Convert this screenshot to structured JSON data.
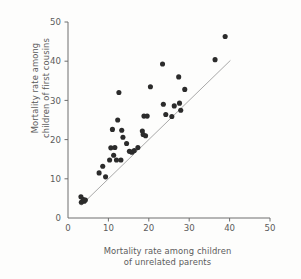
{
  "chart_data": {
    "type": "scatter",
    "title": "",
    "xlabel": "Mortality rate among children of unrelated parents",
    "xlabel_line1": "Mortality rate among children",
    "xlabel_line2": "of unrelated parents",
    "ylabel": "Mortality rate among children of first cousins",
    "ylabel_line1": "Mortality rate among",
    "ylabel_line2": "children of first cousins",
    "xlim": [
      0,
      50
    ],
    "ylim": [
      0,
      50
    ],
    "xticks": [
      0,
      10,
      20,
      30,
      40,
      50
    ],
    "yticks": [
      0,
      10,
      20,
      30,
      40,
      50
    ],
    "xticklabels": [
      "0",
      "10",
      "20",
      "30",
      "40",
      "50"
    ],
    "yticklabels": [
      "0",
      "10",
      "20",
      "30",
      "40",
      "50"
    ],
    "grid": false,
    "legend": null,
    "point_color": "#2b2b2b",
    "point_size": 3.1,
    "reference_line": {
      "label": "line of equality",
      "x": [
        3.2,
        40.2
      ],
      "y": [
        3.2,
        40.2
      ],
      "color": "#a9a9a9",
      "width": 1.0
    },
    "series": [
      {
        "name": "Populations",
        "points": [
          [
            3.2,
            5.4
          ],
          [
            3.3,
            4.0
          ],
          [
            3.8,
            4.7
          ],
          [
            4.0,
            4.3
          ],
          [
            4.3,
            4.6
          ],
          [
            7.7,
            11.5
          ],
          [
            8.6,
            13.2
          ],
          [
            9.3,
            10.5
          ],
          [
            10.3,
            14.8
          ],
          [
            10.6,
            17.9
          ],
          [
            11.0,
            22.6
          ],
          [
            11.3,
            16.0
          ],
          [
            11.6,
            18.0
          ],
          [
            12.0,
            14.8
          ],
          [
            12.3,
            25.0
          ],
          [
            12.6,
            32.0
          ],
          [
            13.1,
            14.8
          ],
          [
            13.3,
            22.4
          ],
          [
            13.6,
            20.6
          ],
          [
            14.5,
            19.0
          ],
          [
            15.2,
            17.0
          ],
          [
            15.8,
            16.8
          ],
          [
            16.4,
            17.2
          ],
          [
            17.3,
            18.0
          ],
          [
            18.4,
            22.2
          ],
          [
            18.6,
            21.3
          ],
          [
            18.8,
            26.0
          ],
          [
            19.2,
            21.0
          ],
          [
            19.6,
            26.0
          ],
          [
            20.4,
            33.5
          ],
          [
            23.4,
            39.3
          ],
          [
            23.6,
            29.0
          ],
          [
            24.2,
            26.4
          ],
          [
            25.7,
            25.9
          ],
          [
            26.3,
            28.6
          ],
          [
            27.4,
            36.0
          ],
          [
            27.6,
            29.3
          ],
          [
            27.9,
            27.5
          ],
          [
            28.9,
            32.8
          ],
          [
            36.4,
            40.4
          ],
          [
            38.9,
            46.3
          ]
        ]
      }
    ]
  },
  "axes": {
    "x_origin_px": 68,
    "y_origin_px": 218,
    "px_per_unit_x": 4.04,
    "px_per_unit_y": 3.92
  }
}
